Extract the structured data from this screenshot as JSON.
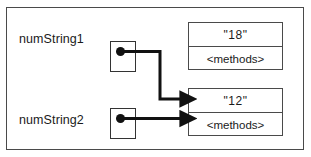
{
  "figure": {
    "background_color": "#ffffff",
    "frame_color": "#4a4a4a",
    "line_color": "#111111",
    "text_color": "#1a1a1a"
  },
  "variables": [
    {
      "id": "numString1",
      "label": "numString1",
      "points_to": "obj_12"
    },
    {
      "id": "numString2",
      "label": "numString2",
      "points_to": "obj_12"
    }
  ],
  "objects": [
    {
      "id": "obj_18",
      "value": "\"18\"",
      "methods": "<methods>"
    },
    {
      "id": "obj_12",
      "value": "\"12\"",
      "methods": "<methods>"
    }
  ]
}
